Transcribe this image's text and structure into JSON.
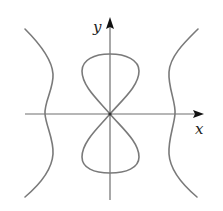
{
  "diagram": {
    "type": "curve-plot",
    "axes": {
      "x_label": "x",
      "y_label": "y",
      "origin": [
        110,
        114
      ]
    },
    "curves": [
      {
        "name": "left-branch",
        "description": "wavy vertical branch left of origin, crossing x-axis"
      },
      {
        "name": "figure-eight",
        "description": "lemniscate-like loop symmetric about origin, lobes above and below"
      },
      {
        "name": "right-branch",
        "description": "wavy vertical branch right of origin, crossing x-axis"
      }
    ],
    "colors": {
      "curve": "#7a7a7a",
      "axis": "#6e6e6e",
      "arrow": "#111111",
      "background": "#ffffff"
    }
  }
}
